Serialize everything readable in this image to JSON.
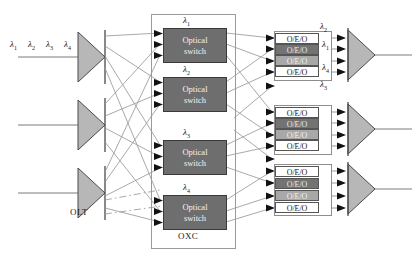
{
  "diagram": {
    "colors": {
      "triangle_fill": "#b7b7b7",
      "triangle_stroke": "#4a4a4a",
      "switch_fill": "#6e6e6e",
      "oeo_shade_dark": "#737373",
      "oeo_shade_mid": "#a8a8a8",
      "line": "#8c8c8c",
      "arrow": "#111111"
    },
    "input": {
      "lambdas": [
        "λ₁",
        "λ₂",
        "λ₃",
        "λ₄"
      ],
      "lambda_parts": [
        {
          "sym": "λ",
          "sub": "1"
        },
        {
          "sym": "λ",
          "sub": "2"
        },
        {
          "sym": "λ",
          "sub": "3"
        },
        {
          "sym": "λ",
          "sub": "4"
        }
      ]
    },
    "olt": {
      "caption": "OLT",
      "count": 3,
      "node_name": "olt-demux-triangle"
    },
    "oxc": {
      "caption": "OXC",
      "switches": [
        {
          "lambda_sym": "λ",
          "lambda_sub": "1",
          "line1": "Optical",
          "line2": "switch"
        },
        {
          "lambda_sym": "λ",
          "lambda_sub": "2",
          "line1": "Optical",
          "line2": "switch"
        },
        {
          "lambda_sym": "λ",
          "lambda_sub": "3",
          "line1": "Optical",
          "line2": "switch"
        },
        {
          "lambda_sym": "λ",
          "lambda_sub": "4",
          "line1": "Optical",
          "line2": "switch"
        }
      ]
    },
    "oeo": {
      "label": "O/E/O",
      "groups": [
        {
          "boxes": [
            {
              "label": "O/E/O",
              "shade": "none"
            },
            {
              "label": "O/E/O",
              "shade": "dark"
            },
            {
              "label": "O/E/O",
              "shade": "mid"
            },
            {
              "label": "O/E/O",
              "shade": "none"
            }
          ],
          "out_lambdas": [
            {
              "sym": "λ",
              "sub": "2"
            },
            {
              "sym": "λ",
              "sub": "1"
            },
            {
              "sym": "",
              "sub": ""
            },
            {
              "sym": "λ",
              "sub": "4"
            }
          ]
        },
        {
          "boxes": [
            {
              "label": "O/E/O",
              "shade": "none"
            },
            {
              "label": "O/E/O",
              "shade": "dark"
            },
            {
              "label": "O/E/O",
              "shade": "mid"
            },
            {
              "label": "O/E/O",
              "shade": "none"
            }
          ],
          "out_lambdas": [
            {
              "sym": "",
              "sub": ""
            },
            {
              "sym": "",
              "sub": ""
            },
            {
              "sym": "",
              "sub": ""
            },
            {
              "sym": "",
              "sub": ""
            }
          ]
        },
        {
          "boxes": [
            {
              "label": "O/E/O",
              "shade": "none"
            },
            {
              "label": "O/E/O",
              "shade": "dark"
            },
            {
              "label": "O/E/O",
              "shade": "mid"
            },
            {
              "label": "O/E/O",
              "shade": "none"
            }
          ],
          "out_lambdas": [
            {
              "sym": "",
              "sub": ""
            },
            {
              "sym": "",
              "sub": ""
            },
            {
              "sym": "",
              "sub": ""
            },
            {
              "sym": "",
              "sub": ""
            }
          ]
        }
      ],
      "floating_lambda": {
        "sym": "λ",
        "sub": "3"
      }
    },
    "output": {
      "mux_count": 3,
      "node_name": "output-mux-triangle"
    }
  }
}
